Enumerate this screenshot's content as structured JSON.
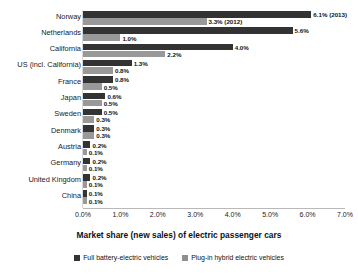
{
  "axis_title": "Market share (new sales) of electric passenger cars",
  "tick_labels": [
    "0.0%",
    "1.0%",
    "2.0%",
    "3.0%",
    "4.0%",
    "5.0%",
    "6.0%",
    "7.0%"
  ],
  "legend": [
    {
      "label": "Full battery-electric vehicles",
      "color": "#333333"
    },
    {
      "label": "Plug-in hybrid electric vehicles",
      "color": "#8f8f8f"
    }
  ],
  "chart_data": {
    "type": "bar",
    "orientation": "horizontal",
    "title": "",
    "xlabel": "Market share (new sales) of electric passenger cars",
    "ylabel": "",
    "xlim": [
      0,
      7
    ],
    "xtick_step": 1.0,
    "grid": false,
    "legend_position": "bottom",
    "categories": [
      "Norway",
      "Netherlands",
      "California",
      "US (incl. California)",
      "France",
      "Japan",
      "Sweden",
      "Denmark",
      "Austria",
      "Germany",
      "United Kingdom",
      "China"
    ],
    "series": [
      {
        "name": "Full battery-electric vehicles",
        "color": "#333333",
        "values": [
          6.1,
          5.6,
          4.0,
          1.3,
          0.8,
          0.6,
          0.5,
          0.3,
          0.2,
          0.2,
          0.2,
          0.1
        ],
        "labels": [
          "6.1% (2013)",
          "5.6%",
          "4.0%",
          "1.3%",
          "0.8%",
          "0.6%",
          "0.5%",
          "0.3%",
          "0.2%",
          "0.2%",
          "0.2%",
          "0.1%"
        ]
      },
      {
        "name": "Plug-in hybrid electric vehicles",
        "color": "#999999",
        "values": [
          3.3,
          1.0,
          2.2,
          0.8,
          0.5,
          0.5,
          0.3,
          0.3,
          0.1,
          0.1,
          0.1,
          0.1
        ],
        "labels": [
          "3.3% (2012)",
          "1.0%",
          "2.2%",
          "0.8%",
          "0.5%",
          "0.5%",
          "0.3%",
          "0.3%",
          "0.1%",
          "0.1%",
          "0.1%",
          "0.1%"
        ]
      }
    ]
  }
}
